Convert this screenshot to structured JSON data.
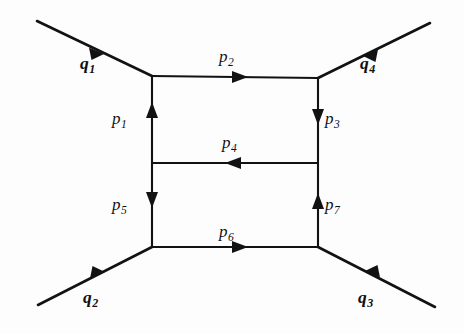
{
  "figure": {
    "type": "feynman-diagram",
    "name": "double-box two-loop diagram",
    "background_color": "#fdfdfd",
    "line_color": "#121212"
  },
  "internal_momenta": [
    {
      "id": "p1",
      "base": "p",
      "subscript": "1",
      "edge": "left-vertical-upper",
      "arrow_direction": "up",
      "label_x": 112,
      "label_y": 110
    },
    {
      "id": "p2",
      "base": "p",
      "subscript": "2",
      "edge": "top-rail",
      "arrow_direction": "right",
      "label_x": 219,
      "label_y": 48
    },
    {
      "id": "p3",
      "base": "p",
      "subscript": "3",
      "edge": "right-vertical-upper",
      "arrow_direction": "down",
      "label_x": 325,
      "label_y": 110
    },
    {
      "id": "p4",
      "base": "p",
      "subscript": "4",
      "edge": "middle-rung",
      "arrow_direction": "left",
      "label_x": 222,
      "label_y": 134
    },
    {
      "id": "p5",
      "base": "p",
      "subscript": "5",
      "edge": "left-vertical-lower",
      "arrow_direction": "down",
      "label_x": 112,
      "label_y": 196
    },
    {
      "id": "p6",
      "base": "p",
      "subscript": "6",
      "edge": "bottom-rail",
      "arrow_direction": "right",
      "label_x": 219,
      "label_y": 223
    },
    {
      "id": "p7",
      "base": "p",
      "subscript": "7",
      "edge": "right-vertical-lower",
      "arrow_direction": "up",
      "label_x": 325,
      "label_y": 196
    }
  ],
  "external_momenta": [
    {
      "id": "q1",
      "base": "q",
      "subscript": "1",
      "leg": "upper-left",
      "arrow_direction": "inward",
      "label_x": 80,
      "label_y": 55
    },
    {
      "id": "q2",
      "base": "q",
      "subscript": "2",
      "leg": "lower-left",
      "arrow_direction": "inward",
      "label_x": 83,
      "label_y": 289
    },
    {
      "id": "q3",
      "base": "q",
      "subscript": "3",
      "leg": "lower-right",
      "arrow_direction": "inward",
      "label_x": 358,
      "label_y": 289
    },
    {
      "id": "q4",
      "base": "q",
      "subscript": "4",
      "leg": "upper-right",
      "arrow_direction": "inward",
      "label_x": 360,
      "label_y": 55
    }
  ],
  "vertices": [
    {
      "name": "top-left",
      "x": 152,
      "y": 76
    },
    {
      "name": "top-right",
      "x": 318,
      "y": 78
    },
    {
      "name": "mid-left",
      "x": 152,
      "y": 163
    },
    {
      "name": "mid-right",
      "x": 318,
      "y": 163
    },
    {
      "name": "bottom-left",
      "x": 152,
      "y": 247
    },
    {
      "name": "bottom-right",
      "x": 318,
      "y": 247
    }
  ]
}
